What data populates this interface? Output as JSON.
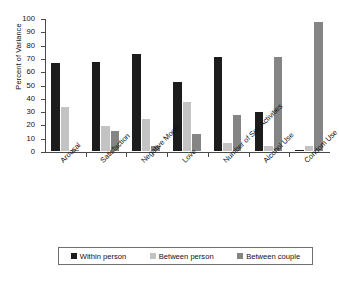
{
  "chart_data": {
    "type": "bar",
    "title": "",
    "subtitle": "",
    "xlabel": "",
    "ylabel": "Percent of Variance",
    "ylim": [
      0,
      100
    ],
    "ytick_step": 10,
    "yticks": [
      100,
      90,
      80,
      70,
      60,
      50,
      40,
      30,
      20,
      10,
      0
    ],
    "grid": false,
    "legend_position": "bottom",
    "categories": [
      "Arousal",
      "Satisfaction",
      "Negative Mood",
      "Love",
      "Number of Sex Activities",
      "Alcohol Use",
      "Condom Use"
    ],
    "series": [
      {
        "name": "Within person",
        "color": "#1c1c1c",
        "values": [
          66,
          67,
          73,
          52,
          71,
          29,
          1
        ]
      },
      {
        "name": "Between person",
        "color": "#c3c3c3",
        "values": [
          33,
          19,
          24,
          37,
          6,
          4,
          4
        ]
      },
      {
        "name": "Between couple",
        "color": "#858585",
        "values": [
          1,
          15,
          4,
          13,
          27,
          71,
          97
        ]
      }
    ]
  },
  "legend": {
    "items": [
      {
        "label": "Within person",
        "swatch": "black-square-swatch"
      },
      {
        "label": "Between person",
        "swatch": "light-gray-square-swatch"
      },
      {
        "label": "Between couple",
        "swatch": "medium-gray-square-swatch"
      }
    ]
  }
}
